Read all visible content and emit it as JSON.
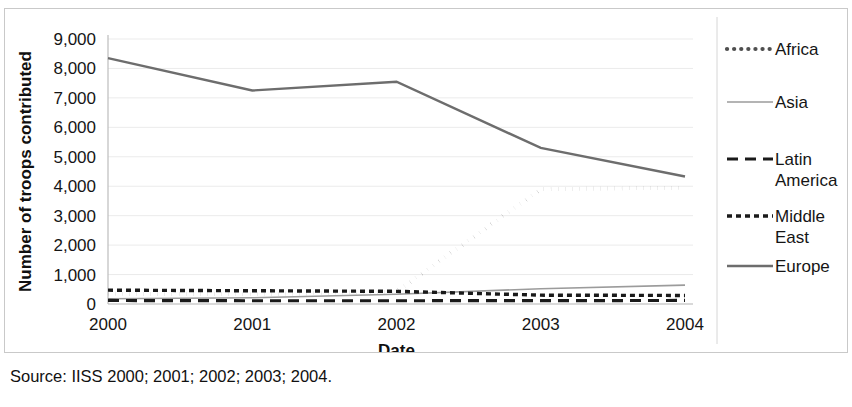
{
  "source_note": "Source: IISS 2000; 2001; 2002; 2003; 2004.",
  "axis": {
    "ylabel": "Number of troops contributed",
    "xlabel": "Date"
  },
  "chart_data": {
    "type": "line",
    "title": "",
    "xlabel": "Date",
    "ylabel": "Number of troops contributed",
    "categories": [
      "2000",
      "2001",
      "2002",
      "2003",
      "2004"
    ],
    "x": [
      2000,
      2001,
      2002,
      2003,
      2004
    ],
    "ylim": [
      0,
      9000
    ],
    "xlim": [
      2000,
      2004
    ],
    "ytick_labels": [
      "0",
      "1,000",
      "2,000",
      "3,000",
      "4,000",
      "5,000",
      "6,000",
      "7,000",
      "8,000",
      "9,000"
    ],
    "yticks": [
      0,
      1000,
      2000,
      3000,
      4000,
      5000,
      6000,
      7000,
      8000,
      9000
    ],
    "grid": true,
    "legend_position": "right",
    "series": [
      {
        "name": "Africa",
        "values": [
          350,
          330,
          420,
          3900,
          3950
        ],
        "color": "#4f4f4f",
        "style": "dotted",
        "width": 4.2,
        "dasharray": "0.1,7"
      },
      {
        "name": "Asia",
        "values": [
          180,
          210,
          330,
          520,
          640
        ],
        "color": "#9b9b9b",
        "style": "solid",
        "width": 1.6,
        "dasharray": "none"
      },
      {
        "name": "Latin America",
        "values": [
          120,
          110,
          110,
          115,
          120
        ],
        "color": "#1a1a1a",
        "style": "dashed",
        "width": 3.2,
        "dasharray": "11,7"
      },
      {
        "name": "Middle East",
        "values": [
          470,
          450,
          430,
          300,
          290
        ],
        "color": "#1a1a1a",
        "style": "fine-dashed",
        "width": 3.4,
        "dasharray": "5,4"
      },
      {
        "name": "Europe",
        "values": [
          8350,
          7250,
          7550,
          5300,
          4330
        ],
        "color": "#6d6d6d",
        "style": "solid",
        "width": 2.4,
        "dasharray": "none"
      }
    ]
  },
  "legend": {
    "entries": [
      {
        "label": "Africa"
      },
      {
        "label": "Asia"
      },
      {
        "label": "Latin America"
      },
      {
        "label": "Middle East"
      },
      {
        "label": "Europe"
      }
    ]
  }
}
